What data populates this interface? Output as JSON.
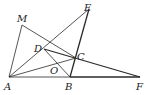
{
  "figure": {
    "type": "geometry-diagram",
    "points": {
      "A": {
        "x": 9,
        "y": 77,
        "label": "A",
        "lx": 4,
        "ly": 90
      },
      "M": {
        "x": 22,
        "y": 25,
        "label": "M",
        "lx": 17,
        "ly": 22
      },
      "E": {
        "x": 89,
        "y": 9,
        "label": "E",
        "lx": 84,
        "ly": 11
      },
      "D": {
        "x": 44,
        "y": 49,
        "label": "D",
        "lx": 34,
        "ly": 52
      },
      "C": {
        "x": 76,
        "y": 58,
        "label": "C",
        "lx": 77,
        "ly": 60
      },
      "O": {
        "x": 57,
        "y": 64,
        "label": "O",
        "lx": 50,
        "ly": 74
      },
      "B": {
        "x": 70,
        "y": 77,
        "label": "B",
        "lx": 65,
        "ly": 90
      },
      "F": {
        "x": 140,
        "y": 77,
        "label": "F",
        "lx": 136,
        "ly": 90
      }
    },
    "segments": [
      {
        "from": "A",
        "to": "M",
        "weight": "thin"
      },
      {
        "from": "M",
        "to": "C",
        "weight": "thin"
      },
      {
        "from": "A",
        "to": "E",
        "weight": "thin"
      },
      {
        "from": "E",
        "to": "B",
        "weight": "thick"
      },
      {
        "from": "D",
        "to": "F",
        "weight": "thick"
      },
      {
        "from": "D",
        "to": "B",
        "weight": "thin"
      },
      {
        "from": "A",
        "to": "C",
        "weight": "thin"
      },
      {
        "from": "A",
        "to": "B",
        "weight": "thin"
      },
      {
        "from": "B",
        "to": "F",
        "weight": "thick"
      }
    ]
  }
}
